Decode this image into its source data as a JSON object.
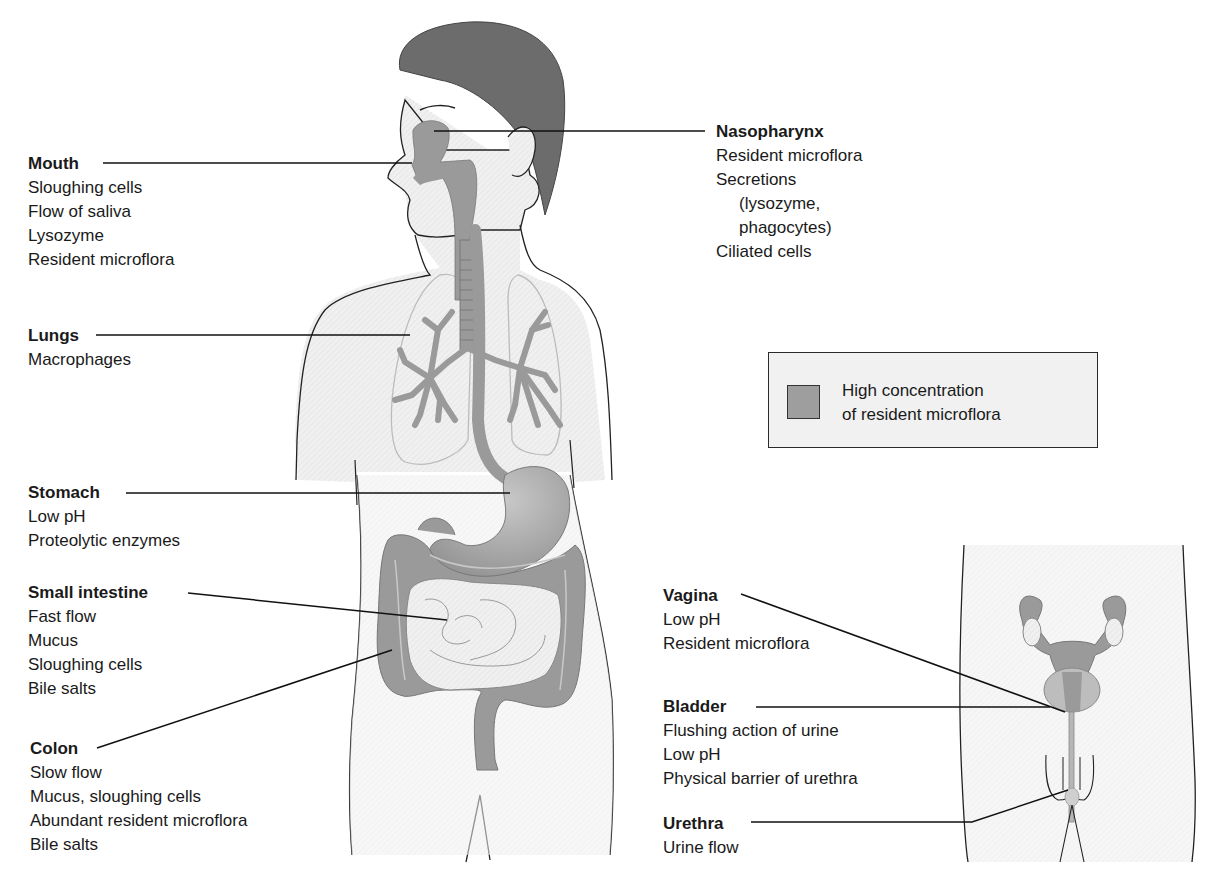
{
  "figure": {
    "type": "anatomical-diagram"
  },
  "legend": {
    "swatch_color": "#9e9e9e",
    "line1": "High concentration",
    "line2": "of resident microflora"
  },
  "colors": {
    "organ_fill": "#9a9a9a",
    "hair": "#6b6b6b",
    "skin": "#efefef",
    "outline": "#222222",
    "leader_line": "#111111"
  },
  "sites": {
    "mouth": {
      "title": "Mouth",
      "items": [
        "Sloughing cells",
        "Flow of saliva",
        "Lysozyme",
        "Resident microflora"
      ]
    },
    "nasopharynx": {
      "title": "Nasopharynx",
      "items": [
        "Resident microflora",
        "Secretions",
        "(lysozyme,",
        "phagocytes)",
        "Ciliated cells"
      ]
    },
    "lungs": {
      "title": "Lungs",
      "items": [
        "Macrophages"
      ]
    },
    "stomach": {
      "title": "Stomach",
      "items": [
        "Low pH",
        "Proteolytic enzymes"
      ]
    },
    "small_intestine": {
      "title": "Small intestine",
      "items": [
        "Fast flow",
        "Mucus",
        "Sloughing cells",
        "Bile salts"
      ]
    },
    "colon": {
      "title": "Colon",
      "items": [
        "Slow flow",
        "Mucus, sloughing cells",
        "Abundant resident microflora",
        "Bile salts"
      ]
    },
    "vagina": {
      "title": "Vagina",
      "items": [
        "Low pH",
        "Resident microflora"
      ]
    },
    "bladder": {
      "title": "Bladder",
      "items": [
        "Flushing action of urine",
        "Low pH",
        "Physical barrier of urethra"
      ]
    },
    "urethra": {
      "title": "Urethra",
      "items": [
        "Urine flow"
      ]
    }
  }
}
